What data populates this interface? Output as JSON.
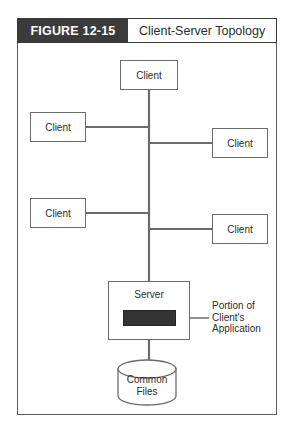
{
  "figure": {
    "label": "FIGURE 12-15",
    "title": "Client-Server Topology"
  },
  "colors": {
    "header_fill": "#3b3b3b",
    "header_text": "#ffffff",
    "frame_border": "#5c5c5c",
    "node_border": "#6b6b6b",
    "line": "#6b6b6b",
    "chip_fill": "#343434",
    "background": "#ffffff",
    "text": "#2c2c2c"
  },
  "diagram": {
    "type": "network-topology",
    "nodes": [
      {
        "id": "client-top",
        "label": "Client",
        "shape": "rect"
      },
      {
        "id": "client-left-1",
        "label": "Client",
        "shape": "rect"
      },
      {
        "id": "client-right-1",
        "label": "Client",
        "shape": "rect"
      },
      {
        "id": "client-left-2",
        "label": "Client",
        "shape": "rect"
      },
      {
        "id": "client-right-2",
        "label": "Client",
        "shape": "rect"
      },
      {
        "id": "server",
        "label": "Server",
        "shape": "rect"
      },
      {
        "id": "common-files",
        "label_line1": "Common",
        "label_line2": "Files",
        "shape": "cylinder"
      }
    ],
    "annotation": {
      "line1": "Portion of",
      "line2": "Client's",
      "line3": "Application"
    }
  }
}
